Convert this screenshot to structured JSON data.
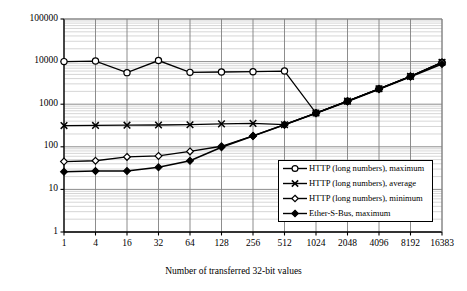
{
  "chart_data": {
    "type": "line",
    "title": "",
    "xlabel": "Number of transferred 32-bit values",
    "ylabel": "Exchange duration [ms]",
    "xscale": "categorical",
    "yscale": "log",
    "ylim": [
      1,
      100000
    ],
    "grid": true,
    "legend_position": "inside-lower-right",
    "categories": [
      "1",
      "4",
      "16",
      "32",
      "64",
      "128",
      "256",
      "512",
      "1024",
      "2048",
      "4096",
      "8192",
      "16383"
    ],
    "ytick_labels": [
      "100000",
      "10000",
      "1000",
      "100",
      "10",
      "1"
    ],
    "ytick_values": [
      100000,
      10000,
      1000,
      100,
      10,
      1
    ],
    "series": [
      {
        "name": "HTTP (long numbers), maximum",
        "marker": "open-circle",
        "color": "#000000",
        "values": [
          10000,
          10300,
          5500,
          10600,
          5600,
          5700,
          5800,
          6000,
          620,
          1180,
          2300,
          4500,
          9600
        ]
      },
      {
        "name": "HTTP (long numbers), average",
        "marker": "cross-x",
        "color": "#000000",
        "values": [
          315,
          318,
          322,
          325,
          330,
          345,
          355,
          330,
          620,
          1180,
          2300,
          4500,
          9600
        ]
      },
      {
        "name": "HTTP (long numbers), minimum",
        "marker": "open-diamond",
        "color": "#000000",
        "values": [
          45,
          47,
          58,
          61,
          78,
          103,
          180,
          330,
          620,
          1180,
          2300,
          4500,
          9600
        ]
      },
      {
        "name": "Ether-S-Bus, maximum",
        "marker": "filled-diamond",
        "color": "#000000",
        "values": [
          26,
          27,
          27,
          33,
          47,
          98,
          180,
          330,
          610,
          1160,
          2250,
          4400,
          8800
        ]
      }
    ]
  },
  "legend": {
    "items": [
      {
        "label": "HTTP (long numbers), maximum",
        "marker": "open-circle"
      },
      {
        "label": "HTTP (long numbers), average",
        "marker": "cross-x"
      },
      {
        "label": "HTTP (long numbers), minimum",
        "marker": "open-diamond"
      },
      {
        "label": "Ether-S-Bus, maximum",
        "marker": "filled-diamond"
      }
    ]
  },
  "colors": {
    "line": "#000000",
    "major_grid": "#808080",
    "minor_grid": "#c4c4c4",
    "axis": "#000000",
    "plot_background": "#ffffff"
  }
}
